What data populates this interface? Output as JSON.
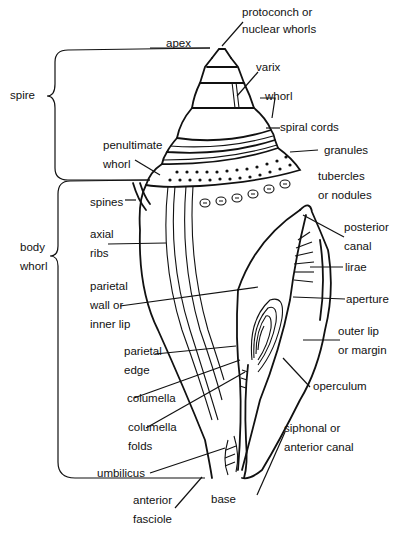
{
  "diagram": {
    "colors": {
      "ink": "#111111",
      "background": "#ffffff"
    },
    "regions": [
      {
        "id": "spire",
        "label": "spire"
      },
      {
        "id": "body_whorl",
        "label": "body\nwhorl"
      }
    ],
    "labels": {
      "apex": "apex",
      "protoconch": "protoconch or\nnuclear whorls",
      "varix": "varix",
      "whorl": "whorl",
      "spire": "spire",
      "spiral_cords": "spiral cords",
      "penultimate_whorl": "penultimate\nwhorl",
      "granules": "granules",
      "tubercles": "tubercles\nor nodules",
      "spines": "spines",
      "body_whorl": "body\nwhorl",
      "axial_ribs": "axial\nribs",
      "posterior_canal": "posterior\ncanal",
      "lirae": "lirae",
      "parietal_wall": "parietal\nwall or\ninner lip",
      "aperture": "aperture",
      "outer_lip": "outer lip\nor margin",
      "parietal_edge": "parietal\nedge",
      "columella": "columella",
      "operculum": "operculum",
      "columella_folds": "columella\nfolds",
      "siphonal_canal": "siphonal or\nanterior canal",
      "umbilicus": "umbilicus",
      "anterior_fasciole": "anterior\nfasciole",
      "base": "base"
    }
  }
}
